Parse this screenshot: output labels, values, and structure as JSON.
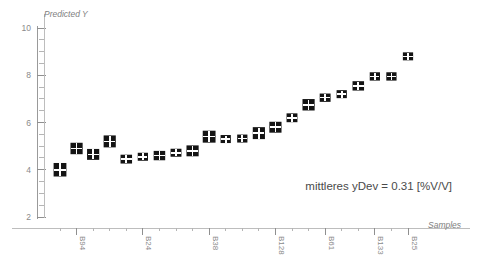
{
  "chart_data": {
    "type": "scatter",
    "title": "",
    "ylabel": "Predicted Y",
    "xlabel": "Samples",
    "ylim": [
      2,
      10
    ],
    "y_ticks": [
      2,
      4,
      6,
      8,
      10
    ],
    "y_tick_labels": [
      "2",
      "4",
      "6",
      "8",
      "10"
    ],
    "y_minor_step": 0.5,
    "grid": false,
    "legend": "none",
    "marker_style": "filled-black-square-with-white-error-cross",
    "x_tick_labels": [
      "B94",
      "B24",
      "B38",
      "B128",
      "B61",
      "B133",
      "B25"
    ],
    "x_tick_label_indices": [
      1,
      5,
      9,
      13,
      16,
      19,
      21
    ],
    "annotations": [
      {
        "name": "mean-ydev-annotation",
        "text": "mittleres yDev = 0.31 [%V/V]"
      }
    ],
    "categories": [
      "B94",
      "S2",
      "S3",
      "S4",
      "B24",
      "S6",
      "S7",
      "S8",
      "B38",
      "S10",
      "S11",
      "S12",
      "B128",
      "S14",
      "S15",
      "B61",
      "S17",
      "S18",
      "B133",
      "S20",
      "B25",
      "S22"
    ],
    "values": [
      4.0,
      4.9,
      4.65,
      5.2,
      4.45,
      4.55,
      4.6,
      4.72,
      4.8,
      5.4,
      5.3,
      5.32,
      5.55,
      5.8,
      6.2,
      6.75,
      7.05,
      7.2,
      7.55,
      7.95,
      7.95,
      8.8
    ],
    "errors": [
      0.52,
      0.44,
      0.42,
      0.46,
      0.34,
      0.26,
      0.36,
      0.3,
      0.42,
      0.46,
      0.28,
      0.26,
      0.46,
      0.42,
      0.34,
      0.44,
      0.32,
      0.3,
      0.36,
      0.32,
      0.32,
      0.26
    ],
    "x_errors": [
      0.4,
      0.38,
      0.38,
      0.38,
      0.36,
      0.32,
      0.36,
      0.34,
      0.38,
      0.4,
      0.32,
      0.32,
      0.38,
      0.38,
      0.34,
      0.38,
      0.34,
      0.32,
      0.36,
      0.32,
      0.32,
      0.32
    ],
    "mean_ydev": 0.31,
    "unit": "[%V/V]",
    "colors": {
      "marker": "#141414",
      "cross": "#ffffff",
      "axis": "#9a9a9a",
      "text": "#8a8a8a",
      "annotation": "#4a4a4a",
      "background": "#ffffff"
    }
  }
}
